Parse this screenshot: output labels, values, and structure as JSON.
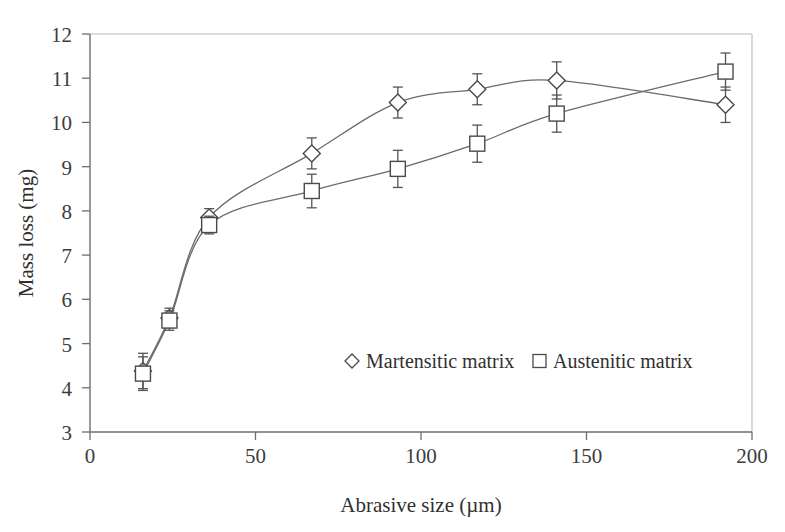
{
  "chart_data": {
    "type": "line",
    "title": "",
    "xlabel": "Abrasive size (µm)",
    "ylabel": "Mass loss (mg)",
    "xlim": [
      0,
      200
    ],
    "ylim": [
      3,
      12
    ],
    "xticks": [
      0,
      50,
      100,
      150,
      200
    ],
    "yticks": [
      3,
      4,
      5,
      6,
      7,
      8,
      9,
      10,
      11,
      12
    ],
    "grid": false,
    "legend_position": "center",
    "series": [
      {
        "name": "Martensitic matrix",
        "marker": "open-diamond",
        "x": [
          16,
          24,
          36,
          67,
          93,
          117,
          141,
          192
        ],
        "values": [
          4.38,
          5.58,
          7.85,
          9.3,
          10.45,
          10.75,
          10.95,
          10.4
        ],
        "yerr": [
          0.4,
          0.22,
          0.2,
          0.35,
          0.35,
          0.35,
          0.42,
          0.4
        ]
      },
      {
        "name": "Austenitic matrix",
        "marker": "open-square",
        "x": [
          16,
          24,
          36,
          67,
          93,
          117,
          141,
          192
        ],
        "values": [
          4.32,
          5.52,
          7.68,
          8.45,
          8.95,
          9.52,
          10.2,
          11.15
        ],
        "yerr": [
          0.38,
          0.22,
          0.2,
          0.38,
          0.42,
          0.42,
          0.42,
          0.42
        ]
      }
    ]
  },
  "axes": {
    "x_tick_labels": [
      "0",
      "50",
      "100",
      "150",
      "200"
    ],
    "y_tick_labels": [
      "3",
      "4",
      "5",
      "6",
      "7",
      "8",
      "9",
      "10",
      "11",
      "12"
    ],
    "x_axis_title": "Abrasive size (µm)",
    "y_axis_title": "Mass loss (mg)"
  },
  "legend": {
    "entries": [
      {
        "label": "Martensitic matrix",
        "marker": "open-diamond"
      },
      {
        "label": "Austenitic matrix",
        "marker": "open-square"
      }
    ]
  }
}
